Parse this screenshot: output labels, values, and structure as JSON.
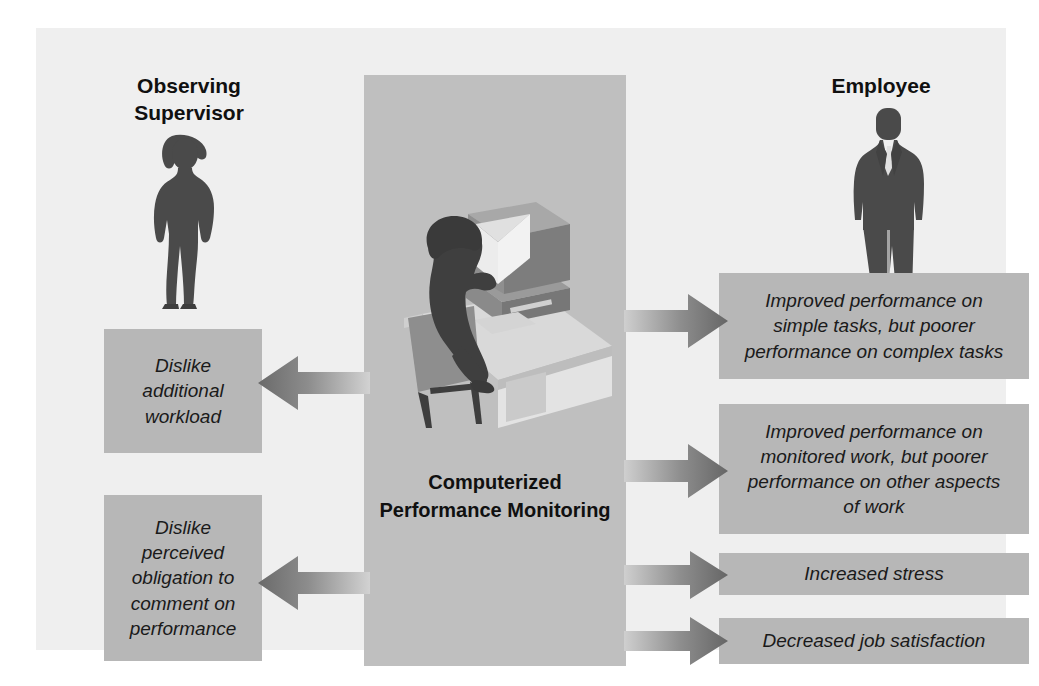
{
  "diagram": {
    "title": "Computerized Performance Monitoring",
    "center": {
      "label_lines": [
        "Computerized",
        "Performance",
        "Monitoring"
      ],
      "illustration_name": "person-at-computer-workstation"
    },
    "left": {
      "person_label_lines": [
        "Observing",
        "Supervisor"
      ],
      "person_icon": "female-supervisor-silhouette",
      "boxes": [
        {
          "id": "dislike-workload",
          "lines": [
            "Dislike",
            "additional",
            "workload"
          ]
        },
        {
          "id": "dislike-obligation",
          "lines": [
            "Dislike",
            "perceived",
            "obligation to",
            "comment on",
            "performance"
          ]
        }
      ]
    },
    "right": {
      "person_label": "Employee",
      "person_icon": "male-employee-silhouette",
      "boxes": [
        {
          "id": "simple-complex",
          "lines": [
            "Improved performance on",
            "simple tasks, but poorer",
            "performance on complex tasks"
          ]
        },
        {
          "id": "monitored-work",
          "lines": [
            "Improved performance on",
            "monitored work, but poorer",
            "performance on other aspects",
            "of work"
          ]
        },
        {
          "id": "increased-stress",
          "lines": [
            "Increased stress"
          ]
        },
        {
          "id": "decreased-satisfaction",
          "lines": [
            "Decreased job satisfaction"
          ]
        }
      ]
    },
    "arrows": [
      {
        "id": "arrow-left-1",
        "direction": "left",
        "from": "center",
        "to": "dislike-workload"
      },
      {
        "id": "arrow-left-2",
        "direction": "left",
        "from": "center",
        "to": "dislike-obligation"
      },
      {
        "id": "arrow-right-1",
        "direction": "right",
        "from": "center",
        "to": "simple-complex"
      },
      {
        "id": "arrow-right-2",
        "direction": "right",
        "from": "center",
        "to": "monitored-work"
      },
      {
        "id": "arrow-right-3",
        "direction": "right",
        "from": "center",
        "to": "increased-stress"
      },
      {
        "id": "arrow-right-4",
        "direction": "right",
        "from": "center",
        "to": "decreased-satisfaction"
      }
    ],
    "colors": {
      "page_background": "#ffffff",
      "panel_background": "#efefef",
      "center_band": "#bfbfbf",
      "box_fill": "#b7b7b7",
      "text": "#1a1a1a",
      "figure_silhouette": "#4a4a4a",
      "arrow_dark": "#6e6e6e",
      "arrow_light": "#cfcfcf"
    }
  }
}
